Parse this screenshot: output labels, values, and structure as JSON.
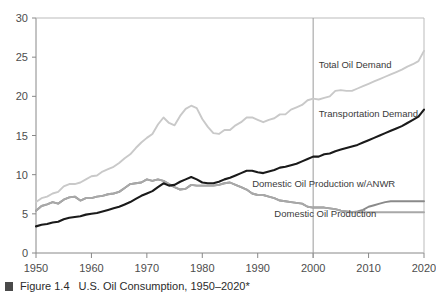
{
  "caption": {
    "marker": "square-bullet",
    "figure_number": "Figure 1.4",
    "title": "U.S. Oil Consumption, 1950–2020*"
  },
  "chart_data": {
    "type": "line",
    "title": "U.S. Oil Consumption, 1950–2020*",
    "xlabel": "",
    "ylabel": "",
    "xlim": [
      1950,
      2020
    ],
    "ylim": [
      0,
      30
    ],
    "grid": false,
    "legend_position": "inline-right",
    "xticks": [
      1950,
      1960,
      1970,
      1980,
      1990,
      2000,
      2010,
      2020
    ],
    "yticks": [
      0,
      5,
      10,
      15,
      20,
      25,
      30
    ],
    "xtick_labels": [
      "1950",
      "1960",
      "1970",
      "1980",
      "1990",
      "2000",
      "2010",
      "2020"
    ],
    "ytick_labels": [
      "0",
      "5",
      "10",
      "15",
      "20",
      "25",
      "30"
    ],
    "annotations": [
      {
        "text": "Total Oil Demand",
        "x": 2001,
        "y": 23.6
      },
      {
        "text": "Transportation Demand",
        "x": 2001,
        "y": 17.3
      },
      {
        "text": "Domestic Oil Production w/ANWR",
        "x": 1989,
        "y": 8.4
      },
      {
        "text": "Domestic Oil Production",
        "x": 1993,
        "y": 4.6
      }
    ],
    "divider_line": {
      "x": 2000,
      "label": "projection-divider"
    },
    "x": [
      1950,
      1951,
      1952,
      1953,
      1954,
      1955,
      1956,
      1957,
      1958,
      1959,
      1960,
      1961,
      1962,
      1963,
      1964,
      1965,
      1966,
      1967,
      1968,
      1969,
      1970,
      1971,
      1972,
      1973,
      1974,
      1975,
      1976,
      1977,
      1978,
      1979,
      1980,
      1981,
      1982,
      1983,
      1984,
      1985,
      1986,
      1987,
      1988,
      1989,
      1990,
      1991,
      1992,
      1993,
      1994,
      1995,
      1996,
      1997,
      1998,
      1999,
      2000,
      2001,
      2002,
      2003,
      2004,
      2005,
      2006,
      2007,
      2008,
      2009,
      2010,
      2011,
      2012,
      2013,
      2014,
      2015,
      2016,
      2017,
      2018,
      2019,
      2020
    ],
    "series": [
      {
        "name": "Total Oil Demand",
        "color": "#c9c9c9",
        "values": [
          6.5,
          7.0,
          7.2,
          7.6,
          7.8,
          8.5,
          8.8,
          8.8,
          9.0,
          9.4,
          9.8,
          9.9,
          10.4,
          10.7,
          11.0,
          11.5,
          12.1,
          12.6,
          13.4,
          14.1,
          14.7,
          15.2,
          16.4,
          17.3,
          16.6,
          16.3,
          17.5,
          18.4,
          18.8,
          18.5,
          17.1,
          16.1,
          15.3,
          15.2,
          15.7,
          15.7,
          16.3,
          16.7,
          17.3,
          17.3,
          17.0,
          16.7,
          17.0,
          17.2,
          17.7,
          17.7,
          18.3,
          18.6,
          18.9,
          19.5,
          19.7,
          19.6,
          19.8,
          20.0,
          20.7,
          20.8,
          20.7,
          20.7,
          21.0,
          21.3,
          21.6,
          21.9,
          22.2,
          22.5,
          22.8,
          23.1,
          23.4,
          23.8,
          24.1,
          24.5,
          25.8
        ]
      },
      {
        "name": "Transportation Demand",
        "color": "#1a1a1a",
        "values": [
          3.4,
          3.6,
          3.7,
          3.9,
          4.0,
          4.3,
          4.5,
          4.6,
          4.7,
          4.9,
          5.0,
          5.1,
          5.3,
          5.5,
          5.7,
          5.9,
          6.2,
          6.5,
          6.9,
          7.3,
          7.6,
          7.9,
          8.4,
          8.9,
          8.6,
          8.7,
          9.1,
          9.4,
          9.7,
          9.4,
          9.0,
          8.9,
          8.9,
          9.1,
          9.4,
          9.6,
          9.9,
          10.2,
          10.5,
          10.5,
          10.3,
          10.2,
          10.4,
          10.6,
          10.9,
          11.0,
          11.2,
          11.4,
          11.7,
          12.0,
          12.3,
          12.3,
          12.6,
          12.7,
          13.0,
          13.2,
          13.4,
          13.6,
          13.8,
          14.1,
          14.4,
          14.7,
          15.0,
          15.3,
          15.6,
          15.9,
          16.2,
          16.6,
          17.0,
          17.4,
          18.3
        ]
      },
      {
        "name": "Domestic Oil Production w/ANWR",
        "color": "#8a8a8a",
        "values": [
          5.4,
          6.0,
          6.2,
          6.5,
          6.3,
          6.8,
          7.1,
          7.2,
          6.7,
          7.0,
          7.0,
          7.2,
          7.3,
          7.5,
          7.6,
          7.8,
          8.3,
          8.8,
          8.9,
          9.0,
          9.4,
          9.2,
          9.4,
          9.2,
          8.8,
          8.4,
          8.1,
          8.2,
          8.7,
          8.6,
          8.6,
          8.6,
          8.6,
          8.7,
          8.9,
          9.0,
          8.7,
          8.4,
          8.1,
          7.6,
          7.4,
          7.4,
          7.2,
          7.0,
          6.7,
          6.6,
          6.5,
          6.4,
          6.3,
          5.9,
          5.8,
          5.8,
          5.8,
          5.7,
          5.6,
          5.4,
          5.3,
          5.2,
          5.3,
          5.5,
          5.9,
          6.1,
          6.3,
          6.5,
          6.6,
          6.6,
          6.6,
          6.6,
          6.6,
          6.6,
          6.6
        ]
      },
      {
        "name": "Domestic Oil Production",
        "color": "#a8a8a8",
        "values": [
          5.4,
          6.0,
          6.2,
          6.5,
          6.3,
          6.8,
          7.1,
          7.2,
          6.7,
          7.0,
          7.0,
          7.2,
          7.3,
          7.5,
          7.6,
          7.8,
          8.3,
          8.8,
          8.9,
          9.0,
          9.4,
          9.2,
          9.4,
          9.2,
          8.8,
          8.4,
          8.1,
          8.2,
          8.7,
          8.6,
          8.6,
          8.6,
          8.6,
          8.7,
          8.9,
          9.0,
          8.7,
          8.4,
          8.1,
          7.6,
          7.4,
          7.4,
          7.2,
          7.0,
          6.7,
          6.6,
          6.5,
          6.4,
          6.3,
          5.9,
          5.8,
          5.8,
          5.8,
          5.7,
          5.6,
          5.4,
          5.3,
          5.2,
          5.2,
          5.2,
          5.2,
          5.2,
          5.2,
          5.2,
          5.2,
          5.2,
          5.2,
          5.2,
          5.2,
          5.2,
          5.2
        ]
      }
    ]
  }
}
